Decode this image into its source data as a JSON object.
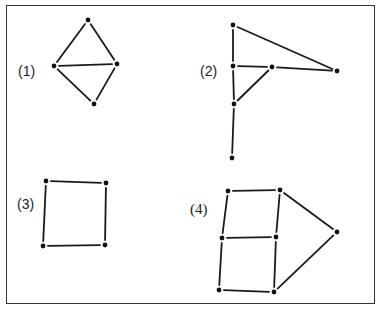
{
  "figure": {
    "frame": {
      "x": 6,
      "y": 5,
      "width": 369,
      "height": 299
    },
    "colors": {
      "stroke": "#1a1a1a",
      "node": "#111111",
      "frame": "#333333",
      "background": "#ffffff"
    },
    "graphs": [
      {
        "id": 1,
        "label": "(1)",
        "label_pos": {
          "x": 18,
          "y": 64
        },
        "nodes": {
          "top": [
            88,
            20
          ],
          "left": [
            54,
            66
          ],
          "right": [
            117,
            64
          ],
          "bottom": [
            94,
            104
          ]
        },
        "edges": [
          [
            "top",
            "left"
          ],
          [
            "top",
            "right"
          ],
          [
            "left",
            "right"
          ],
          [
            "left",
            "bottom"
          ],
          [
            "right",
            "bottom"
          ]
        ]
      },
      {
        "id": 2,
        "label": "(2)",
        "label_pos": {
          "x": 200,
          "y": 64
        },
        "nodes": {
          "a": [
            233,
            25
          ],
          "b": [
            233,
            66
          ],
          "c": [
            272,
            67
          ],
          "d": [
            337,
            71
          ],
          "e": [
            234,
            104
          ],
          "f": [
            232,
            158
          ]
        },
        "edges": [
          [
            "a",
            "b"
          ],
          [
            "a",
            "d"
          ],
          [
            "b",
            "c"
          ],
          [
            "c",
            "d"
          ],
          [
            "b",
            "e"
          ],
          [
            "c",
            "e"
          ],
          [
            "e",
            "f"
          ]
        ]
      },
      {
        "id": 3,
        "label": "(3)",
        "label_pos": {
          "x": 17,
          "y": 197
        },
        "nodes": {
          "tl": [
            46,
            181
          ],
          "tr": [
            106,
            183
          ],
          "bl": [
            43,
            246
          ],
          "br": [
            105,
            245
          ]
        },
        "edges": [
          [
            "tl",
            "tr"
          ],
          [
            "tl",
            "bl"
          ],
          [
            "tr",
            "br"
          ],
          [
            "bl",
            "br"
          ]
        ]
      },
      {
        "id": 4,
        "label": "(4)",
        "label_pos": {
          "x": 190,
          "y": 202
        },
        "nodes": {
          "a": [
            228,
            191
          ],
          "b": [
            280,
            190
          ],
          "c": [
            222,
            238
          ],
          "d": [
            276,
            237
          ],
          "e": [
            337,
            232
          ],
          "f": [
            219,
            290
          ],
          "g": [
            274,
            292
          ]
        },
        "edges": [
          [
            "a",
            "b"
          ],
          [
            "a",
            "c"
          ],
          [
            "b",
            "d"
          ],
          [
            "b",
            "e"
          ],
          [
            "c",
            "d"
          ],
          [
            "c",
            "f"
          ],
          [
            "d",
            "g"
          ],
          [
            "f",
            "g"
          ],
          [
            "g",
            "e"
          ]
        ]
      }
    ]
  }
}
